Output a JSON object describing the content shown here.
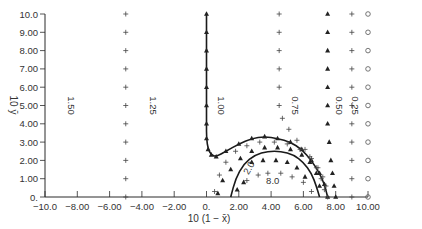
{
  "chart_data": {
    "type": "scatter",
    "title": "",
    "xlabel": "10 (1 − x̄)",
    "ylabel": "10 ȳ",
    "xlim": [
      -10,
      10
    ],
    "ylim": [
      0,
      10
    ],
    "grid": false,
    "x_ticks": [
      -10,
      -8,
      -6,
      -4,
      -2,
      0,
      2,
      4,
      6,
      8,
      10
    ],
    "x_tick_labels": [
      "−10.0",
      "−8.00",
      "−6.00",
      "−4.00",
      "−2.00",
      "0.",
      "2.00",
      "4.00",
      "6.00",
      "8.00",
      "10.00"
    ],
    "y_ticks": [
      0,
      1,
      2,
      3,
      4,
      5,
      6,
      7,
      8,
      9,
      10
    ],
    "y_tick_labels": [
      "0.",
      "1.00",
      "2.00",
      "3.00",
      "4.00",
      "5.00",
      "6.00",
      "7.00",
      "8.00",
      "9.00",
      "10.0"
    ],
    "annotations": [
      {
        "text": "1.50",
        "x": -8.6,
        "y": 5.0,
        "rotation": 90
      },
      {
        "text": "1.25",
        "x": -3.5,
        "y": 5.0,
        "rotation": 90
      },
      {
        "text": "1.00",
        "x": 0.7,
        "y": 5.0,
        "rotation": 90
      },
      {
        "text": "0.75",
        "x": 5.3,
        "y": 5.0,
        "rotation": 90
      },
      {
        "text": "0.50",
        "x": 8.0,
        "y": 5.0,
        "rotation": 90
      },
      {
        "text": "0.25",
        "x": 9.0,
        "y": 5.0,
        "rotation": 90
      },
      {
        "text": "2.0",
        "x": 2.8,
        "y": 1.5,
        "rotation": -60
      },
      {
        "text": "8.0",
        "x": 4.1,
        "y": 0.7,
        "rotation": 0
      }
    ],
    "series": [
      {
        "name": "1.25 (+)",
        "marker": "+",
        "x": [
          -5,
          -5,
          -5,
          -5,
          -5,
          -5,
          -5,
          -5,
          -5,
          -5,
          -5
        ],
        "y": [
          0,
          1,
          2,
          3,
          4,
          5,
          6,
          7,
          8,
          9,
          10
        ]
      },
      {
        "name": "1.00 (▲ line)",
        "marker": "triangle",
        "line": true,
        "x": [
          0,
          0,
          0,
          0,
          0,
          0,
          0,
          0,
          0.1,
          0.3,
          0.6,
          1.2,
          2.0,
          2.8,
          3.6,
          4.4,
          5.2,
          5.9,
          6.5,
          7.0,
          7.3,
          7.5
        ],
        "y": [
          10,
          9,
          8,
          7,
          6,
          5,
          4,
          3.2,
          2.6,
          2.3,
          2.2,
          2.5,
          2.9,
          3.2,
          3.3,
          3.2,
          3.0,
          2.6,
          2.0,
          1.3,
          0.7,
          0
        ]
      },
      {
        "name": "0.75 (+)",
        "marker": "+",
        "x": [
          4.5,
          4.5,
          4.5,
          4.5,
          4.5,
          4.5,
          4.7,
          5.1,
          5.6,
          6.1,
          6.5,
          6.9,
          7.2,
          7.4,
          7.5
        ],
        "y": [
          10,
          9,
          8,
          7,
          6,
          5,
          4.3,
          3.7,
          3.1,
          2.6,
          2.1,
          1.6,
          1.1,
          0.6,
          0
        ]
      },
      {
        "name": "0.50 (▲)",
        "marker": "triangle",
        "x": [
          7.5,
          7.5,
          7.5,
          7.5,
          7.5,
          7.5,
          7.5,
          7.6,
          7.7,
          7.8,
          7.9,
          8.0
        ],
        "y": [
          10,
          9,
          8,
          7,
          6,
          5,
          4,
          3,
          2,
          1.3,
          0.6,
          0
        ]
      },
      {
        "name": "0.25 (+)",
        "marker": "+",
        "x": [
          9,
          9,
          9,
          9,
          9,
          9,
          9,
          9,
          9,
          9,
          9
        ],
        "y": [
          10,
          9,
          8,
          7,
          6,
          5,
          4,
          3,
          2,
          1,
          0
        ]
      },
      {
        "name": "0.00 (○)",
        "marker": "circle",
        "x": [
          10,
          10,
          10,
          10,
          10,
          10,
          10,
          10,
          10,
          10,
          10
        ],
        "y": [
          10,
          9,
          8,
          7,
          6,
          5,
          4,
          3,
          2,
          1,
          0
        ]
      },
      {
        "name": "2.0 (curve)",
        "marker": "none",
        "line": true,
        "x": [
          1.5,
          1.8,
          2.3,
          3.0,
          3.8,
          4.6,
          5.4,
          6.0,
          6.5,
          6.8,
          7.0
        ],
        "y": [
          0,
          1.0,
          1.8,
          2.3,
          2.5,
          2.5,
          2.3,
          1.9,
          1.3,
          0.6,
          0
        ]
      },
      {
        "name": "inner (+)",
        "marker": "+",
        "x": [
          0.5,
          0.8,
          1.2,
          1.8,
          2.5,
          3.3,
          4.2,
          5.0,
          5.8,
          6.4,
          6.8,
          7.1,
          7.3,
          2.5,
          3.2,
          3.8,
          4.6,
          5.3,
          6.0,
          6.5
        ],
        "y": [
          0.3,
          1.2,
          1.9,
          2.5,
          2.8,
          3.0,
          3.0,
          2.9,
          2.6,
          2.2,
          1.6,
          1.0,
          0.4,
          0.9,
          1.2,
          1.3,
          1.3,
          1.1,
          0.8,
          0.3
        ]
      },
      {
        "name": "inner (▲)",
        "marker": "triangle",
        "x": [
          0.7,
          1.0,
          1.5,
          2.1,
          2.8,
          3.6,
          4.4,
          5.2,
          5.9,
          6.4,
          6.8,
          7.0,
          2.8,
          3.5,
          4.3,
          5.0,
          5.6,
          6.1,
          1.9,
          2.3
        ],
        "y": [
          0.2,
          0.9,
          1.5,
          2.1,
          2.5,
          2.7,
          2.7,
          2.6,
          2.3,
          1.9,
          1.3,
          0.6,
          1.9,
          2.0,
          2.0,
          1.9,
          1.6,
          1.1,
          0.4,
          0.8
        ]
      }
    ]
  }
}
